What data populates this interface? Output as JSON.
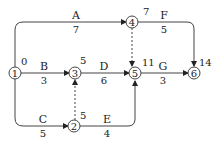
{
  "diagram": {
    "type": "activity-on-arrow network",
    "nodes": [
      {
        "id": "1",
        "label": "1",
        "time": "0"
      },
      {
        "id": "2",
        "label": "2",
        "time": "5"
      },
      {
        "id": "3",
        "label": "3",
        "time": "5"
      },
      {
        "id": "4",
        "label": "4",
        "time": "7"
      },
      {
        "id": "5",
        "label": "5",
        "time": "11"
      },
      {
        "id": "6",
        "label": "6",
        "time": "14"
      }
    ],
    "activities": [
      {
        "name": "A",
        "duration": "7",
        "from": "1",
        "to": "4"
      },
      {
        "name": "B",
        "duration": "3",
        "from": "1",
        "to": "3"
      },
      {
        "name": "C",
        "duration": "5",
        "from": "1",
        "to": "2"
      },
      {
        "name": "D",
        "duration": "6",
        "from": "3",
        "to": "5"
      },
      {
        "name": "E",
        "duration": "4",
        "from": "2",
        "to": "5"
      },
      {
        "name": "F",
        "duration": "5",
        "from": "4",
        "to": "6"
      },
      {
        "name": "G",
        "duration": "3",
        "from": "5",
        "to": "6"
      }
    ],
    "dummies": [
      {
        "from": "2",
        "to": "3"
      },
      {
        "from": "4",
        "to": "5"
      }
    ]
  }
}
